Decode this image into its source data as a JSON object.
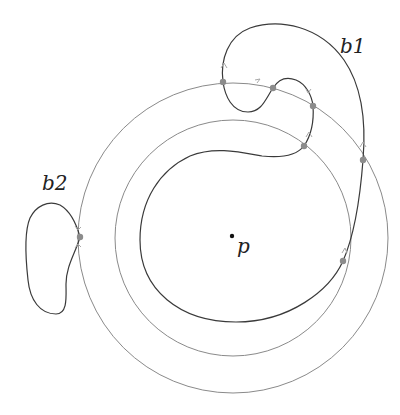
{
  "diagram": {
    "labels": {
      "b1": "b1",
      "b2": "b2",
      "p": "p"
    },
    "colors": {
      "circle": "#8a8a8a",
      "curve": "#3a3a3a",
      "dot": "#8c8c8c",
      "arrow": "#a8a8a8",
      "point": "#111111"
    },
    "circles": [
      {
        "name": "outer",
        "cx": 233,
        "cy": 238,
        "r": 155
      },
      {
        "name": "inner",
        "cx": 233,
        "cy": 238,
        "r": 118
      }
    ],
    "intersection_points": [
      {
        "x": 223,
        "y": 82
      },
      {
        "x": 273,
        "y": 88
      },
      {
        "x": 313,
        "y": 106
      },
      {
        "x": 304,
        "y": 146
      },
      {
        "x": 363,
        "y": 160
      },
      {
        "x": 343,
        "y": 261
      },
      {
        "x": 80,
        "y": 237
      }
    ],
    "center_point": {
      "x": 232,
      "y": 236
    }
  }
}
